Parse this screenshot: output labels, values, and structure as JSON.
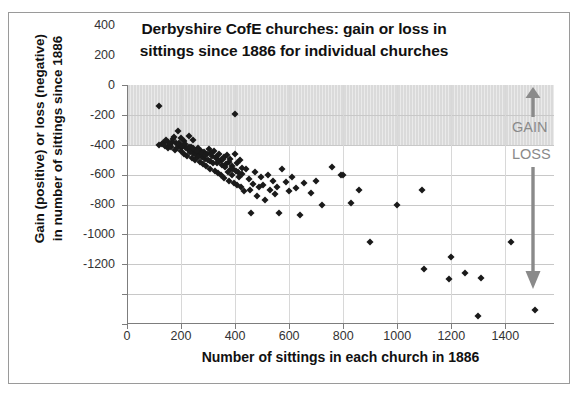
{
  "chart_data": {
    "type": "scatter",
    "title": "Derbyshire CofE churches: gain or loss in sittings since 1886 for individual churches",
    "title_line1": "Derbyshire CofE churches: gain or loss in",
    "title_line2": "sittings since 1886 for individual churches",
    "xlabel": "Number of sittings in each church in 1886",
    "ylabel": "Gain (positive) or loss (negative) in number of sittings since 1886",
    "ylabel_line1": "Gain (positive) or loss (negative)",
    "ylabel_line2": "in number of sittings since 1886",
    "xlim": [
      0,
      1580
    ],
    "ylim": [
      -1200,
      400
    ],
    "xticks": [
      0,
      200,
      400,
      600,
      800,
      1000,
      1200,
      1400
    ],
    "yticks": [
      400,
      200,
      0,
      -200,
      -400,
      -600,
      -800,
      -1000,
      -1200
    ],
    "grid": true,
    "legend": "none",
    "marker": "diamond",
    "marker_color": "#1a1a1a",
    "band_color": "#d4d4d4",
    "annotation_color": "#8a8a8a",
    "annotations": [
      {
        "text": "GAIN",
        "arrow": "up",
        "y_range": [
          0,
          400
        ]
      },
      {
        "text": "LOSS",
        "arrow": "down",
        "y_range": [
          -1150,
          0
        ]
      }
    ],
    "shaded_band": {
      "from": 0,
      "to": 400,
      "meaning": "gain"
    },
    "points": [
      [
        120,
        260
      ],
      [
        400,
        205
      ],
      [
        190,
        95
      ],
      [
        175,
        55
      ],
      [
        200,
        45
      ],
      [
        230,
        60
      ],
      [
        245,
        30
      ],
      [
        150,
        20
      ],
      [
        133,
        10
      ],
      [
        128,
        5
      ],
      [
        118,
        0
      ],
      [
        160,
        -5
      ],
      [
        168,
        18
      ],
      [
        182,
        12
      ],
      [
        196,
        -8
      ],
      [
        205,
        -12
      ],
      [
        212,
        25
      ],
      [
        218,
        -20
      ],
      [
        224,
        -30
      ],
      [
        232,
        -40
      ],
      [
        238,
        -15
      ],
      [
        244,
        -55
      ],
      [
        250,
        -35
      ],
      [
        256,
        -70
      ],
      [
        262,
        -25
      ],
      [
        268,
        -60
      ],
      [
        272,
        -45
      ],
      [
        278,
        -80
      ],
      [
        285,
        -50
      ],
      [
        290,
        -95
      ],
      [
        296,
        -65
      ],
      [
        302,
        -30
      ],
      [
        308,
        -110
      ],
      [
        315,
        -75
      ],
      [
        322,
        -40
      ],
      [
        328,
        -90
      ],
      [
        334,
        -120
      ],
      [
        340,
        -60
      ],
      [
        346,
        -105
      ],
      [
        352,
        -135
      ],
      [
        358,
        -85
      ],
      [
        364,
        -150
      ],
      [
        370,
        -70
      ],
      [
        376,
        -115
      ],
      [
        382,
        -95
      ],
      [
        388,
        -140
      ],
      [
        394,
        -165
      ],
      [
        400,
        -60
      ],
      [
        406,
        -125
      ],
      [
        412,
        -180
      ],
      [
        418,
        -100
      ],
      [
        424,
        -155
      ],
      [
        140,
        -10
      ],
      [
        146,
        30
      ],
      [
        152,
        -25
      ],
      [
        158,
        8
      ],
      [
        164,
        -18
      ],
      [
        170,
        40
      ],
      [
        176,
        -35
      ],
      [
        186,
        -22
      ],
      [
        192,
        15
      ],
      [
        198,
        -45
      ],
      [
        204,
        -10
      ],
      [
        210,
        -60
      ],
      [
        216,
        5
      ],
      [
        222,
        -75
      ],
      [
        228,
        -15
      ],
      [
        234,
        -50
      ],
      [
        240,
        -90
      ],
      [
        246,
        -20
      ],
      [
        252,
        -105
      ],
      [
        258,
        -40
      ],
      [
        264,
        -85
      ],
      [
        270,
        -115
      ],
      [
        276,
        -55
      ],
      [
        282,
        -130
      ],
      [
        288,
        -70
      ],
      [
        294,
        -145
      ],
      [
        300,
        -100
      ],
      [
        306,
        -160
      ],
      [
        312,
        -55
      ],
      [
        318,
        -125
      ],
      [
        324,
        -175
      ],
      [
        330,
        -80
      ],
      [
        336,
        -190
      ],
      [
        342,
        -110
      ],
      [
        348,
        -205
      ],
      [
        354,
        -95
      ],
      [
        360,
        -220
      ],
      [
        366,
        -130
      ],
      [
        372,
        -185
      ],
      [
        378,
        -240
      ],
      [
        384,
        -160
      ],
      [
        390,
        -205
      ],
      [
        396,
        -255
      ],
      [
        402,
        -175
      ],
      [
        408,
        -270
      ],
      [
        414,
        -215
      ],
      [
        420,
        -285
      ],
      [
        426,
        -195
      ],
      [
        432,
        -310
      ],
      [
        440,
        -160
      ],
      [
        450,
        -230
      ],
      [
        455,
        -300
      ],
      [
        460,
        -455
      ],
      [
        468,
        -260
      ],
      [
        475,
        -180
      ],
      [
        482,
        -340
      ],
      [
        488,
        -285
      ],
      [
        495,
        -215
      ],
      [
        505,
        -270
      ],
      [
        512,
        -370
      ],
      [
        520,
        -200
      ],
      [
        528,
        -300
      ],
      [
        540,
        -240
      ],
      [
        548,
        -330
      ],
      [
        555,
        -285
      ],
      [
        562,
        -455
      ],
      [
        575,
        -165
      ],
      [
        590,
        -250
      ],
      [
        600,
        -310
      ],
      [
        610,
        -215
      ],
      [
        625,
        -290
      ],
      [
        640,
        -470
      ],
      [
        655,
        -255
      ],
      [
        680,
        -320
      ],
      [
        700,
        -245
      ],
      [
        720,
        -400
      ],
      [
        760,
        -150
      ],
      [
        790,
        -205
      ],
      [
        800,
        -205
      ],
      [
        830,
        -390
      ],
      [
        860,
        -300
      ],
      [
        900,
        -650
      ],
      [
        1000,
        -400
      ],
      [
        1090,
        -305
      ],
      [
        1100,
        -830
      ],
      [
        1190,
        -900
      ],
      [
        1200,
        -750
      ],
      [
        1250,
        -860
      ],
      [
        1300,
        -1145
      ],
      [
        1310,
        -895
      ],
      [
        1420,
        -650
      ],
      [
        1510,
        -1105
      ]
    ]
  }
}
